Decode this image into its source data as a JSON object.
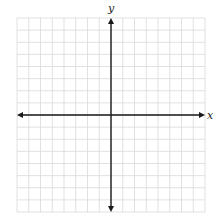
{
  "diagram": {
    "type": "coordinate-plane",
    "grid": {
      "columns": 16,
      "rows": 16,
      "left": 17,
      "top": 18,
      "right": 205,
      "bottom": 212,
      "line_color": "#d9d9d9",
      "line_width": 0.8
    },
    "axes": {
      "color": "#1a1a1a",
      "width": 1.4,
      "x_axis": {
        "label": "x",
        "origin_row": 8,
        "arrows": "both"
      },
      "y_axis": {
        "label": "y",
        "origin_col": 8,
        "arrows": "both"
      }
    },
    "background": "#ffffff"
  }
}
